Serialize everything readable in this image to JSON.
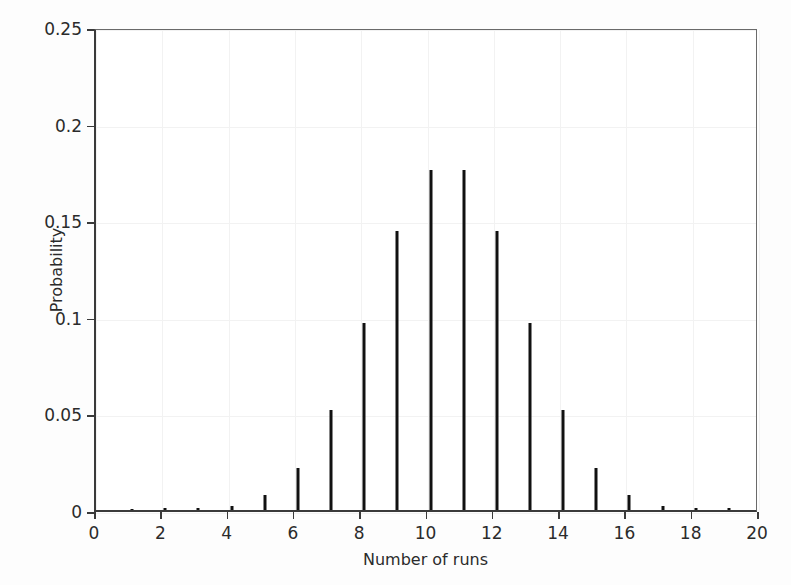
{
  "chart_data": {
    "type": "bar",
    "title": "",
    "subtitle": "",
    "xlabel": "Number of runs",
    "ylabel": "Probability",
    "xlim": [
      0,
      20
    ],
    "ylim": [
      0,
      0.25
    ],
    "grid": true,
    "legend": null,
    "xticks": [
      "0",
      "2",
      "4",
      "6",
      "8",
      "10",
      "12",
      "14",
      "16",
      "18",
      "20"
    ],
    "xtick_values": [
      0,
      2,
      4,
      6,
      8,
      10,
      12,
      14,
      16,
      18,
      20
    ],
    "yticks": [
      "0",
      "0.05",
      "0.1",
      "0.15",
      "0.2",
      "0.25"
    ],
    "ytick_values": [
      0,
      0.05,
      0.1,
      0.15,
      0.2,
      0.25
    ],
    "bar_color": "#111111",
    "categories": [
      0,
      1,
      2,
      3,
      4,
      5,
      6,
      7,
      8,
      9,
      10,
      11,
      12,
      13,
      14,
      15,
      16,
      17,
      18,
      19,
      20
    ],
    "values": [
      0.0,
      0.0005,
      0.0008,
      0.0012,
      0.0022,
      0.008,
      0.022,
      0.052,
      0.097,
      0.1445,
      0.176,
      0.176,
      0.1445,
      0.097,
      0.052,
      0.022,
      0.008,
      0.0022,
      0.0012,
      0.0008,
      0.0
    ],
    "annotations": []
  },
  "axes": {
    "x_title": "Number of runs",
    "y_title": "Probability"
  }
}
